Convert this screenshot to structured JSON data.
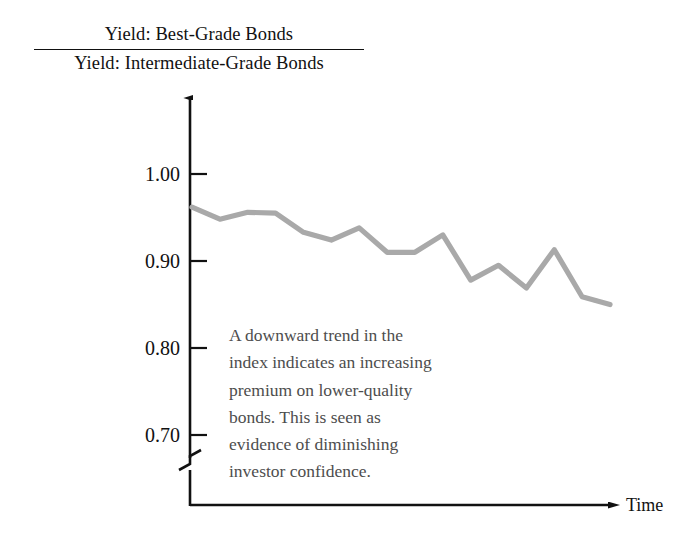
{
  "title": {
    "numerator": "Yield: Best-Grade Bonds",
    "denominator": "Yield: Intermediate-Grade Bonds"
  },
  "axes": {
    "x_label": "Time",
    "y_tick_labels": [
      "1.00",
      "0.90",
      "0.80",
      "0.70"
    ],
    "y_axis_break": "axis-break-zigzag"
  },
  "annotation": {
    "full_text": "A downward trend in the index indicates an increasing premium on lower-quality bonds. This is seen as evidence of diminishing investor confidence.",
    "lines": [
      "A downward trend in the",
      "index indicates an increasing",
      "premium on lower-quality",
      "bonds. This is seen as",
      "evidence of diminishing",
      "investor confidence."
    ]
  },
  "colors": {
    "line": "#a9a9a9",
    "axis": "#111111",
    "annotation_text": "#4d4d4d",
    "title_text": "#111111",
    "background": "#ffffff"
  },
  "chart_data": {
    "type": "line",
    "xlabel": "Time",
    "ylabel": "",
    "grid": false,
    "legend": "none",
    "series_color": "#a9a9a9",
    "axis_break": true,
    "ylim": [
      0.655,
      1.035
    ],
    "y_ticks": [
      1.0,
      0.9,
      0.8,
      0.7
    ],
    "x": [
      0,
      1,
      2,
      3,
      4,
      5,
      6,
      7,
      8,
      9,
      10,
      11,
      12,
      13,
      14,
      15
    ],
    "values": [
      0.962,
      0.948,
      0.956,
      0.955,
      0.933,
      0.924,
      0.938,
      0.91,
      0.91,
      0.93,
      0.878,
      0.895,
      0.869,
      0.913,
      0.859,
      0.85
    ],
    "series": [
      {
        "name": "Yield index (best-grade / intermediate-grade)",
        "values": [
          0.962,
          0.948,
          0.956,
          0.955,
          0.933,
          0.924,
          0.938,
          0.91,
          0.91,
          0.93,
          0.878,
          0.895,
          0.869,
          0.913,
          0.859,
          0.85
        ]
      }
    ],
    "annotations": [
      "A downward trend in the index indicates an increasing premium on lower-quality bonds. This is seen as evidence of diminishing investor confidence."
    ]
  }
}
